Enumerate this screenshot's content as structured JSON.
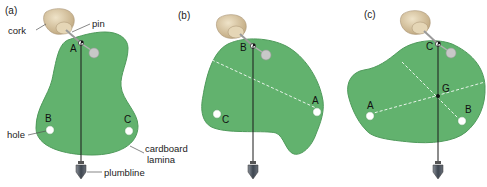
{
  "panels": [
    {
      "id": "a",
      "label": "(a)",
      "pivot_point": "A",
      "points": [
        "A",
        "B",
        "C"
      ]
    },
    {
      "id": "b",
      "label": "(b)",
      "pivot_point": "B",
      "points": [
        "B",
        "A",
        "C"
      ]
    },
    {
      "id": "c",
      "label": "(c)",
      "pivot_point": "C",
      "points": [
        "C",
        "G",
        "A",
        "B"
      ]
    }
  ],
  "labels": {
    "cork": "cork",
    "pin": "pin",
    "hole": "hole",
    "lamina_line1": "cardboard",
    "lamina_line2": "lamina",
    "plumbline": "plumbline"
  },
  "points": {
    "a": {
      "A": "A",
      "B": "B",
      "C": "C"
    },
    "b": {
      "B": "B",
      "A": "A",
      "C": "C"
    },
    "c": {
      "C": "C",
      "G": "G",
      "A": "A",
      "B": "B"
    }
  },
  "colors": {
    "lamina_fill": "#62b26e",
    "lamina_stroke": "#3f8a4c",
    "cork": "#d9c7a4",
    "pin_head": "#c8c8c8",
    "plumb_line": "#1a1a1a",
    "dashed_line": "#e8f4ea"
  }
}
